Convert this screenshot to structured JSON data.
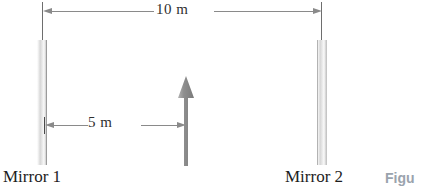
{
  "figure": {
    "dimensions": {
      "total": {
        "label": "10 m",
        "value": 10,
        "unit": "m"
      },
      "object_to_mirror1": {
        "label": "5 m",
        "value": 5,
        "unit": "m"
      }
    },
    "mirrors": [
      {
        "caption": "Mirror 1",
        "icon": "mirror-icon"
      },
      {
        "caption": "Mirror 2",
        "icon": "mirror-icon"
      }
    ],
    "object": {
      "icon": "upward-arrow-icon"
    },
    "figure_tag": "Figu",
    "colors": {
      "dimension_line": "#8a8a8a",
      "object_arrow": "#8c8c8c",
      "caption_text": "#1d1d1d",
      "figure_tag": "#9aa3ad"
    }
  }
}
